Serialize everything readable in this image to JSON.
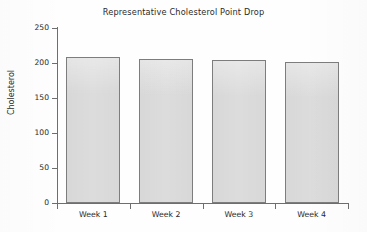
{
  "chart_data": {
    "type": "bar",
    "title": "Representative Cholesterol Point Drop",
    "xlabel": "",
    "ylabel": "Cholesterol",
    "categories": [
      "Week 1",
      "Week 2",
      "Week 3",
      "Week 4"
    ],
    "values": [
      209,
      206,
      204,
      201
    ],
    "ylim": [
      0,
      250
    ],
    "yticks": [
      0,
      50,
      100,
      150,
      200,
      250
    ],
    "ytick_labels": [
      "0",
      "50",
      "100",
      "150",
      "200",
      "250"
    ],
    "grid": false,
    "legend": null,
    "legend_position": "none",
    "series": [
      {
        "name": "Cholesterol",
        "values": [
          209,
          206,
          204,
          201
        ]
      }
    ],
    "colors": {
      "bar_fill": "#dcdcdc",
      "bar_border": "#7d7d7d",
      "axis": "#6e6e6e",
      "text": "#2a2a2a",
      "background": "#ffffff"
    }
  }
}
